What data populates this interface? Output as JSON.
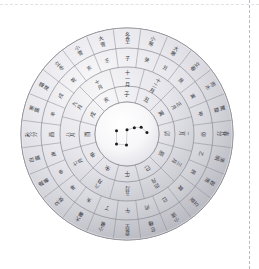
{
  "figure": {
    "title": "Traditional Chinese astronomical and calendrical disc",
    "center": {
      "cx": 127,
      "cy": 134
    },
    "radii": {
      "r_outer": 106,
      "r4": 86,
      "r3": 67,
      "r2": 48,
      "r1": 32
    },
    "colors": {
      "page_background": "#ffffff",
      "disc_light": "#fbfbfc",
      "disc_mid": "#d4d4da",
      "disc_shadow": "#a9a9b1",
      "line": "#8e8e96",
      "text": "#3a3a40",
      "star": "#1a1a1a",
      "dashed_guide": "#b9b9c2"
    }
  },
  "chart_data": {
    "type": "pie",
    "title": "Traditional Chinese astronomical and calendrical disc",
    "legend_position": "none",
    "grid": false,
    "rings": [
      {
        "name": "solar-terms-ring",
        "index": 4,
        "label": "二十四節氣",
        "count": 24,
        "values": [
          15,
          15,
          15,
          15,
          15,
          15,
          15,
          15,
          15,
          15,
          15,
          15,
          15,
          15,
          15,
          15,
          15,
          15,
          15,
          15,
          15,
          15,
          15,
          15
        ],
        "categories": [
          "冬至",
          "小寒",
          "大寒",
          "立春",
          "雨水",
          "驚蟄",
          "春分",
          "清明",
          "穀雨",
          "立夏",
          "小滿",
          "芒種",
          "夏至",
          "小暑",
          "大暑",
          "立秋",
          "處暑",
          "白露",
          "秋分",
          "寒露",
          "霜降",
          "立冬",
          "小雪",
          "大雪"
        ]
      },
      {
        "name": "twelve-branches-ring",
        "index": 3,
        "label": "十二地支",
        "count": 24,
        "values": [
          15,
          15,
          15,
          15,
          15,
          15,
          15,
          15,
          15,
          15,
          15,
          15,
          15,
          15,
          15,
          15,
          15,
          15,
          15,
          15,
          15,
          15,
          15,
          15
        ],
        "categories": [
          "子",
          "癸",
          "丑",
          "艮",
          "寅",
          "甲",
          "卯",
          "乙",
          "辰",
          "巽",
          "巳",
          "丙",
          "午",
          "丁",
          "未",
          "坤",
          "申",
          "庚",
          "酉",
          "辛",
          "戌",
          "乾",
          "亥",
          "壬"
        ]
      },
      {
        "name": "months-ring",
        "index": 2,
        "label": "十二月",
        "count": 12,
        "values": [
          30,
          30,
          30,
          30,
          30,
          30,
          30,
          30,
          30,
          30,
          30,
          30
        ],
        "categories": [
          "十一月",
          "十二月",
          "正月",
          "二月",
          "三月",
          "四月",
          "五月",
          "六月",
          "七月",
          "八月",
          "九月",
          "十月"
        ]
      },
      {
        "name": "zodiac-ring",
        "index": 1,
        "label": "十二宮",
        "count": 12,
        "values": [
          30,
          30,
          30,
          30,
          30,
          30,
          30,
          30,
          30,
          30,
          30,
          30
        ],
        "categories": [
          "子",
          "丑",
          "寅",
          "卯",
          "辰",
          "巳",
          "午",
          "未",
          "申",
          "酉",
          "戌",
          "亥"
        ]
      }
    ],
    "center_field": {
      "name": "big-dipper",
      "label": "北斗七星",
      "star_count": 7,
      "stars": [
        {
          "name": "天樞",
          "x": 0.3,
          "y": 0.44
        },
        {
          "name": "天璇",
          "x": 0.3,
          "y": 0.69
        },
        {
          "name": "天璣",
          "x": 0.49,
          "y": 0.71
        },
        {
          "name": "天權",
          "x": 0.5,
          "y": 0.42
        },
        {
          "name": "玉衡",
          "x": 0.64,
          "y": 0.38
        },
        {
          "name": "開陽",
          "x": 0.77,
          "y": 0.37
        },
        {
          "name": "瑤光",
          "x": 0.88,
          "y": 0.47
        }
      ]
    }
  },
  "annotations": {
    "vertical_guide": "page-edge-guide",
    "horizontal_guide": "page-top-guide"
  }
}
